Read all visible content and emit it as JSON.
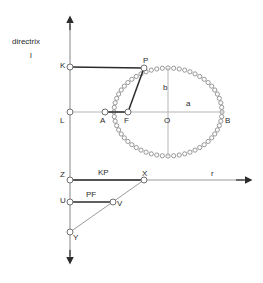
{
  "figure": {
    "background_color": "#ffffff",
    "stroke_dark": "#2b2b2b",
    "stroke_light": "#9a9a9a",
    "marker_stroke": "#8c8c8c",
    "text_color": "#2b2b2b"
  },
  "labels": {
    "directrix": "directrix",
    "directrix_line": "l",
    "K": "K",
    "L": "L",
    "P": "P",
    "A": "A",
    "F": "F",
    "O": "O",
    "B": "B",
    "a": "a",
    "b": "b",
    "Z": "Z",
    "X": "X",
    "U": "U",
    "V": "V",
    "Y": "Y",
    "r": "r",
    "KP": "KP",
    "PF": "PF"
  },
  "points": {
    "K": {
      "x": 70,
      "y": 67
    },
    "L": {
      "x": 70,
      "y": 112
    },
    "P": {
      "x": 144,
      "y": 68
    },
    "A": {
      "x": 105,
      "y": 112
    },
    "F": {
      "x": 128,
      "y": 112
    },
    "O": {
      "x": 168,
      "y": 112
    },
    "B": {
      "x": 222,
      "y": 112
    },
    "Z": {
      "x": 70,
      "y": 180
    },
    "X": {
      "x": 144,
      "y": 180
    },
    "U": {
      "x": 70,
      "y": 202
    },
    "V": {
      "x": 113,
      "y": 202
    },
    "Y": {
      "x": 70,
      "y": 232
    }
  },
  "axes": {
    "vertical": {
      "x": 70,
      "y_top": 18,
      "y_bottom": 262,
      "arrow_top": true,
      "arrow_bottom": true
    },
    "horizontal_r": {
      "y": 180,
      "x_left": 70,
      "x_right": 250,
      "arrow_right": true
    }
  },
  "ellipse": {
    "center_x": 168,
    "center_y": 112,
    "semi_major_a": 54,
    "semi_minor_b": 44,
    "marker_count": 60,
    "marker_radius": 2.1,
    "style": "open-circle-markers"
  },
  "segments": [
    {
      "name": "KP",
      "from": "K",
      "to": "P",
      "weight": "bold"
    },
    {
      "name": "PF",
      "from": "P",
      "to": "F",
      "weight": "bold"
    },
    {
      "name": "AF",
      "from": "A",
      "to": "F",
      "weight": "bold"
    },
    {
      "name": "L-A",
      "from": "L",
      "to": "A",
      "weight": "light"
    },
    {
      "name": "ZX",
      "from": "Z",
      "to": "X",
      "weight": "bold"
    },
    {
      "name": "UV",
      "from": "U",
      "to": "V",
      "weight": "bold"
    },
    {
      "name": "XY",
      "from": "X",
      "to": "Y",
      "weight": "light"
    },
    {
      "name": "b-semi-minor",
      "from": "O-top",
      "to": "O-bottom",
      "weight": "light"
    },
    {
      "name": "a-semi-major",
      "from": "O",
      "to": "B",
      "weight": "light"
    }
  ]
}
